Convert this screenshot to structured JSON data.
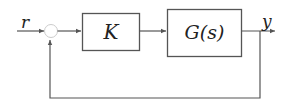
{
  "diagram": {
    "type": "feedback-control-block-diagram",
    "input_label": "r",
    "output_label": "y",
    "blocks": [
      {
        "id": "controller",
        "label": "K"
      },
      {
        "id": "plant",
        "label": "G(s)"
      }
    ],
    "summing_junction": {
      "id": "sum"
    },
    "connections": [
      {
        "from": "r",
        "to": "sum"
      },
      {
        "from": "sum",
        "to": "controller"
      },
      {
        "from": "controller",
        "to": "plant"
      },
      {
        "from": "plant",
        "to": "y"
      },
      {
        "from": "y",
        "to": "sum",
        "type": "feedback"
      }
    ],
    "colors": {
      "line": "#555555",
      "text": "#222222",
      "background": "#ffffff"
    }
  }
}
